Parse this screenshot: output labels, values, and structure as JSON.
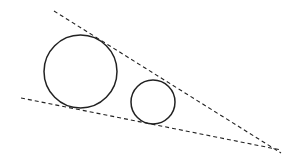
{
  "diagram": {
    "type": "geometry",
    "stroke_color": "#222222",
    "circles": [
      {
        "name": "large-circle",
        "cx": 80.5,
        "cy": 71.5,
        "r": 36.5
      },
      {
        "name": "small-circle",
        "cx": 153,
        "cy": 102,
        "r": 22
      }
    ],
    "tangent_lines": [
      {
        "name": "upper-tangent-line",
        "x1": 54,
        "y1": 11,
        "x2": 281,
        "y2": 153
      },
      {
        "name": "lower-tangent-line",
        "x1": 21,
        "y1": 98,
        "x2": 281,
        "y2": 150
      }
    ]
  }
}
